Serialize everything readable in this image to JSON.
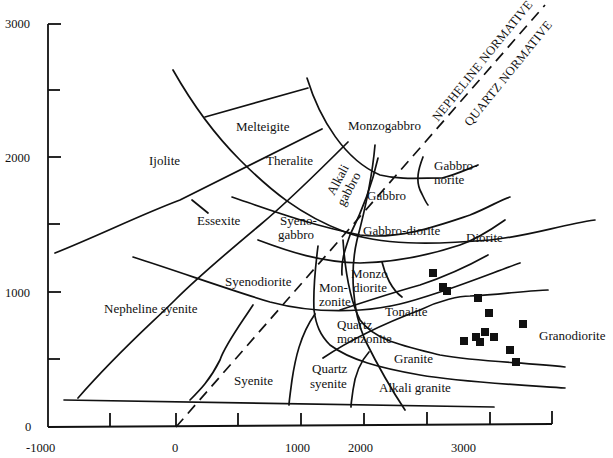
{
  "diagram": {
    "type": "R1-R2 rock classification diagram",
    "y_axis": {
      "ticks": [
        "3000",
        "2000",
        "1000",
        "0"
      ],
      "range": [
        0,
        3000
      ]
    },
    "x_axis": {
      "ticks": [
        "-1000",
        "0",
        "1000",
        "2000",
        "3000"
      ],
      "range": [
        -1000,
        3000
      ]
    },
    "divider_labels": {
      "nepheline": "NEPHELINE NORMATIVE",
      "quartz": "QUARTZ NORMATIVE"
    },
    "fields": {
      "melteigite": "Melteigite",
      "monzogabbro": "Monzogabbro",
      "ijolite": "Ijolite",
      "theralite": "Theralite",
      "alkali_gabbro_1": "Alkali",
      "alkali_gabbro_2": "gabbro",
      "gabbro_norite_1": "Gabbro-",
      "gabbro_norite_2": "norite",
      "gabbro": "Gabbro",
      "essexite": "Essexite",
      "syenogabbro_1": "Syeno-",
      "syenogabbro_2": "gabbro",
      "gabbro_diorite": "Gabbro-diorite",
      "diorite": "Diorite",
      "syenodiorite": "Syenodiorite",
      "monzodiorite_1": "Monzo",
      "monzodiorite_2": "diorite",
      "monzonite_1": "Mon-",
      "monzonite_2": "zonite",
      "tonalite": "Tonalite",
      "nepheline_syenite": "Nepheline syenite",
      "quartz_monzonite_1": "Quartz",
      "quartz_monzonite_2": "monzonite",
      "granodiorite": "Granodiorite",
      "granite": "Granite",
      "syenite": "Syenite",
      "quartz_syenite_1": "Quartz",
      "quartz_syenite_2": "syenite",
      "alkali_granite": "Alkali granite"
    },
    "sample_points": [
      {
        "r1": 2110,
        "r2": 1140
      },
      {
        "r1": 2180,
        "r2": 1040
      },
      {
        "r1": 2210,
        "r2": 1000
      },
      {
        "r1": 2480,
        "r2": 950
      },
      {
        "r1": 2560,
        "r2": 840
      },
      {
        "r1": 2850,
        "r2": 760
      },
      {
        "r1": 2520,
        "r2": 700
      },
      {
        "r1": 2600,
        "r2": 660
      },
      {
        "r1": 2470,
        "r2": 660
      },
      {
        "r1": 2490,
        "r2": 630
      },
      {
        "r1": 2370,
        "r2": 640
      },
      {
        "r1": 2760,
        "r2": 580
      },
      {
        "r1": 2790,
        "r2": 480
      }
    ]
  }
}
